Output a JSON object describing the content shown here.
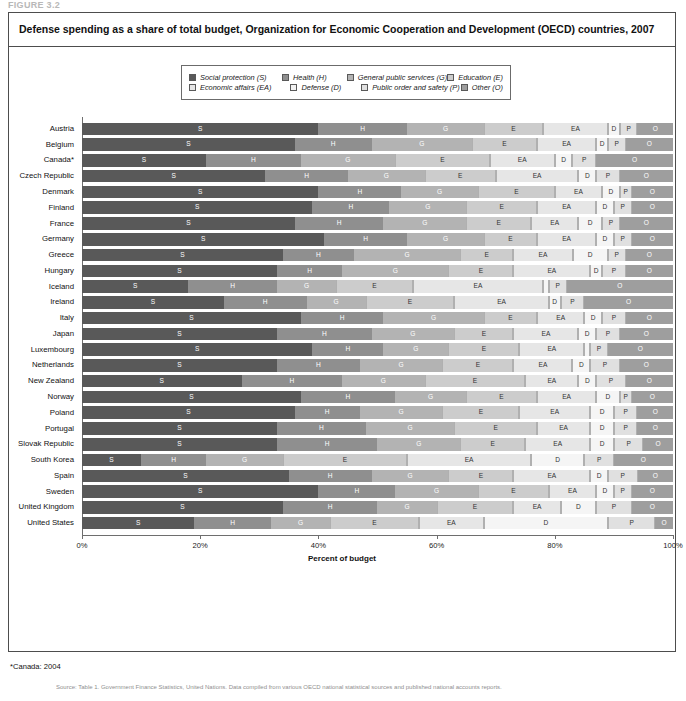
{
  "figure_tag": "FIGURE 3.2",
  "title": "Defense spending as a share of total budget, Organization for Economic Cooperation and Development (OECD) countries, 2007",
  "footnote": "*Canada: 2004",
  "source": "Source: Table 1. Government Finance Statistics, United Nations. Data compiled from various OECD national statistical sources and published national accounts reports.",
  "legend": {
    "rows": [
      [
        {
          "key": "S",
          "label": "Social protection (S)",
          "color": "#595959"
        },
        {
          "key": "H",
          "label": "Health (H)",
          "color": "#8f8f8f"
        },
        {
          "key": "G",
          "label": "General public services (G)",
          "color": "#b3b3b3"
        },
        {
          "key": "E",
          "label": "Education (E)",
          "color": "#cccccc"
        }
      ],
      [
        {
          "key": "EA",
          "label": "Economic affairs (EA)",
          "color": "#e6e6e6"
        },
        {
          "key": "D",
          "label": "Defense (D)",
          "color": "#f2f2f2"
        },
        {
          "key": "P",
          "label": "Public order and safety (P)",
          "color": "#e0e0e0"
        },
        {
          "key": "O",
          "label": "Other (O)",
          "color": "#9e9e9e"
        }
      ]
    ]
  },
  "chart_data": {
    "type": "bar",
    "orientation": "horizontal",
    "stacked": true,
    "normalized": true,
    "title": "Defense spending as a share of total budget, Organization for Economic Cooperation and Development (OECD) countries, 2007",
    "xlabel": "Percent of budget",
    "ylabel": "",
    "xlim": [
      0,
      100
    ],
    "xticks": [
      0,
      20,
      40,
      60,
      80,
      100
    ],
    "xticklabels": [
      "0%",
      "20%",
      "40%",
      "60%",
      "80%",
      "100%"
    ],
    "grid": false,
    "legend_position": "top-center",
    "series": [
      {
        "name": "Social protection (S)",
        "key": "S",
        "color": "#595959",
        "text": "#ffffff"
      },
      {
        "name": "Health (H)",
        "key": "H",
        "color": "#8f8f8f",
        "text": "#ffffff"
      },
      {
        "name": "General public services (G)",
        "key": "G",
        "color": "#b3b3b3",
        "text": "#ffffff"
      },
      {
        "name": "Education (E)",
        "key": "E",
        "color": "#cccccc",
        "text": "#333333"
      },
      {
        "name": "Economic affairs (EA)",
        "key": "EA",
        "color": "#e6e6e6",
        "text": "#333333"
      },
      {
        "name": "Defense (D)",
        "key": "D",
        "color": "#f5f5f5",
        "text": "#333333"
      },
      {
        "name": "Public order and safety (P)",
        "key": "P",
        "color": "#e0e0e0",
        "text": "#333333"
      },
      {
        "name": "Other (O)",
        "key": "O",
        "color": "#9e9e9e",
        "text": "#ffffff"
      }
    ],
    "categories": [
      "Austria",
      "Belgium",
      "Canada*",
      "Czech Republic",
      "Denmark",
      "Finland",
      "France",
      "Germany",
      "Greece",
      "Hungary",
      "Iceland",
      "Ireland",
      "Italy",
      "Japan",
      "Luxembourg",
      "Netherlands",
      "New Zealand",
      "Norway",
      "Poland",
      "Portugal",
      "Slovak Republic",
      "South Korea",
      "Spain",
      "Sweden",
      "United Kingdom",
      "United States"
    ],
    "rows": [
      {
        "country": "Austria",
        "values": {
          "S": 40.0,
          "H": 15.0,
          "G": 13.0,
          "E": 10.0,
          "EA": 11.0,
          "D": 2.0,
          "P": 3.0,
          "O": 6.0
        }
      },
      {
        "country": "Belgium",
        "values": {
          "S": 36.0,
          "H": 13.0,
          "G": 17.0,
          "E": 11.0,
          "EA": 10.0,
          "D": 2.0,
          "P": 3.0,
          "O": 8.0
        }
      },
      {
        "country": "Canada*",
        "values": {
          "S": 21.0,
          "H": 16.0,
          "G": 16.0,
          "E": 16.0,
          "EA": 11.0,
          "D": 3.0,
          "P": 4.0,
          "O": 13.0
        }
      },
      {
        "country": "Czech Republic",
        "values": {
          "S": 31.0,
          "H": 14.0,
          "G": 13.0,
          "E": 12.0,
          "EA": 14.0,
          "D": 3.0,
          "P": 4.0,
          "O": 9.0
        }
      },
      {
        "country": "Denmark",
        "values": {
          "S": 40.0,
          "H": 14.0,
          "G": 13.0,
          "E": 13.0,
          "EA": 8.0,
          "D": 3.0,
          "P": 2.0,
          "O": 7.0
        }
      },
      {
        "country": "Finland",
        "values": {
          "S": 39.0,
          "H": 13.0,
          "G": 13.0,
          "E": 12.0,
          "EA": 10.0,
          "D": 3.0,
          "P": 3.0,
          "O": 7.0
        }
      },
      {
        "country": "France",
        "values": {
          "S": 36.0,
          "H": 15.0,
          "G": 14.0,
          "E": 11.0,
          "EA": 8.0,
          "D": 4.0,
          "P": 3.0,
          "O": 9.0
        }
      },
      {
        "country": "Germany",
        "values": {
          "S": 41.0,
          "H": 14.0,
          "G": 13.0,
          "E": 9.0,
          "EA": 10.0,
          "D": 3.0,
          "P": 3.0,
          "O": 7.0
        }
      },
      {
        "country": "Greece",
        "values": {
          "S": 34.0,
          "H": 12.0,
          "G": 18.0,
          "E": 9.0,
          "EA": 10.0,
          "D": 6.0,
          "P": 3.0,
          "O": 8.0
        }
      },
      {
        "country": "Hungary",
        "values": {
          "S": 33.0,
          "H": 11.0,
          "G": 18.0,
          "E": 11.0,
          "EA": 13.0,
          "D": 2.0,
          "P": 4.0,
          "O": 8.0
        }
      },
      {
        "country": "Iceland",
        "values": {
          "S": 18.0,
          "H": 15.0,
          "G": 10.0,
          "E": 13.0,
          "EA": 22.0,
          "D": 1.0,
          "P": 3.0,
          "O": 18.0
        }
      },
      {
        "country": "Ireland",
        "values": {
          "S": 24.0,
          "H": 14.0,
          "G": 10.0,
          "E": 15.0,
          "EA": 16.0,
          "D": 2.0,
          "P": 4.0,
          "O": 15.0
        }
      },
      {
        "country": "Italy",
        "values": {
          "S": 37.0,
          "H": 14.0,
          "G": 17.0,
          "E": 9.0,
          "EA": 8.0,
          "D": 3.0,
          "P": 4.0,
          "O": 8.0
        }
      },
      {
        "country": "Japan",
        "values": {
          "S": 33.0,
          "H": 16.0,
          "G": 14.0,
          "E": 10.0,
          "EA": 11.0,
          "D": 3.0,
          "P": 4.0,
          "O": 9.0
        }
      },
      {
        "country": "Luxembourg",
        "values": {
          "S": 39.0,
          "H": 12.0,
          "G": 11.0,
          "E": 12.0,
          "EA": 11.0,
          "D": 1.0,
          "P": 3.0,
          "O": 11.0
        }
      },
      {
        "country": "Netherlands",
        "values": {
          "S": 33.0,
          "H": 14.0,
          "G": 14.0,
          "E": 12.0,
          "EA": 10.0,
          "D": 3.0,
          "P": 5.0,
          "O": 9.0
        }
      },
      {
        "country": "New Zealand",
        "values": {
          "S": 27.0,
          "H": 17.0,
          "G": 14.0,
          "E": 17.0,
          "EA": 9.0,
          "D": 3.0,
          "P": 5.0,
          "O": 8.0
        }
      },
      {
        "country": "Norway",
        "values": {
          "S": 37.0,
          "H": 16.0,
          "G": 12.0,
          "E": 12.0,
          "EA": 10.0,
          "D": 4.0,
          "P": 2.0,
          "O": 7.0
        }
      },
      {
        "country": "Poland",
        "values": {
          "S": 36.0,
          "H": 11.0,
          "G": 14.0,
          "E": 13.0,
          "EA": 12.0,
          "D": 4.0,
          "P": 4.0,
          "O": 6.0
        }
      },
      {
        "country": "Portugal",
        "values": {
          "S": 33.0,
          "H": 15.0,
          "G": 15.0,
          "E": 14.0,
          "EA": 9.0,
          "D": 4.0,
          "P": 4.0,
          "O": 6.0
        }
      },
      {
        "country": "Slovak Republic",
        "values": {
          "S": 33.0,
          "H": 17.0,
          "G": 14.0,
          "E": 11.0,
          "EA": 11.0,
          "D": 4.0,
          "P": 5.0,
          "O": 5.0
        }
      },
      {
        "country": "South Korea",
        "values": {
          "S": 10.0,
          "H": 11.0,
          "G": 13.0,
          "E": 21.0,
          "EA": 21.0,
          "D": 9.0,
          "P": 5.0,
          "O": 10.0
        }
      },
      {
        "country": "Spain",
        "values": {
          "S": 35.0,
          "H": 14.0,
          "G": 13.0,
          "E": 11.0,
          "EA": 13.0,
          "D": 3.0,
          "P": 5.0,
          "O": 6.0
        }
      },
      {
        "country": "Sweden",
        "values": {
          "S": 40.0,
          "H": 13.0,
          "G": 14.0,
          "E": 12.0,
          "EA": 8.0,
          "D": 3.0,
          "P": 3.0,
          "O": 7.0
        }
      },
      {
        "country": "United Kingdom",
        "values": {
          "S": 34.0,
          "H": 16.0,
          "G": 10.0,
          "E": 13.0,
          "EA": 8.0,
          "D": 6.0,
          "P": 6.0,
          "O": 7.0
        }
      },
      {
        "country": "United States",
        "values": {
          "S": 19.0,
          "H": 13.0,
          "G": 10.0,
          "E": 15.0,
          "EA": 11.0,
          "D": 21.0,
          "P": 8.0,
          "O": 3.0
        }
      }
    ]
  }
}
